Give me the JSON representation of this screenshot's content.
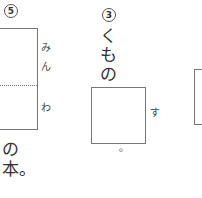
{
  "problem5": {
    "number": "5",
    "hint_top_1": "み",
    "hint_top_2": "ん",
    "hint_bottom": "わ",
    "text_after_1": "の",
    "text_after_2": "本。"
  },
  "problem3": {
    "number": "3",
    "text_before_1": "く",
    "text_before_2": "も",
    "text_before_3": "の",
    "hint": "す",
    "text_after": "。"
  }
}
